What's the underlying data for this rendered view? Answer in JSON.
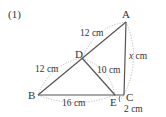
{
  "problem_number": "(1)",
  "points": {
    "A": {
      "label": "A",
      "x": 126,
      "y": 22
    },
    "B": {
      "label": "B",
      "x": 38,
      "y": 95
    },
    "C": {
      "label": "C",
      "x": 124,
      "y": 95
    },
    "D": {
      "label": "D",
      "x": 82,
      "y": 58
    },
    "E": {
      "label": "E",
      "x": 115,
      "y": 95
    }
  },
  "lengths": {
    "AD": "12 cm",
    "DB": "12 cm",
    "DE": "10 cm",
    "BE": "16 cm",
    "EC": "2 cm",
    "AC_var": "x",
    "AC_unit": " cm"
  },
  "colors": {
    "line": "#555555",
    "dotted": "#aaaaaa",
    "text": "#333333"
  }
}
